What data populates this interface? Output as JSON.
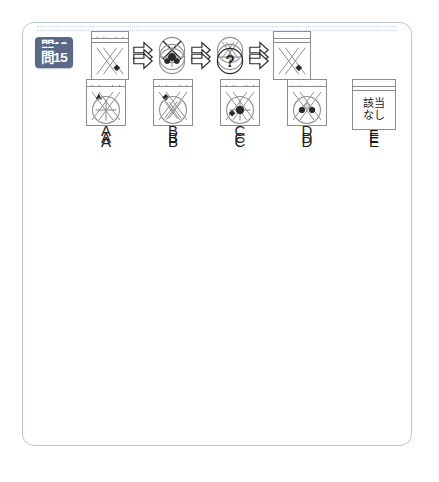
{
  "panel": {
    "border_color": "#b9c4d8",
    "separator_color": "#cfd7e6"
  },
  "badge": {
    "color": "#5a6a86",
    "text_color": "#ffffff"
  },
  "none_label": {
    "line1": "該当",
    "line2": "なし"
  },
  "question_mark": "?",
  "questions": [
    {
      "id": "q13",
      "badge": "問13",
      "sequence": [
        {
          "name": "double-x-box-icon",
          "kind": "box",
          "glyph": "double-x"
        },
        {
          "name": "arrow-right-icon",
          "kind": "arrow",
          "glyph": "arrow"
        },
        {
          "name": "circle-x-icon",
          "kind": "circle",
          "glyph": "circle-x-large"
        },
        {
          "name": "arrow-right-icon",
          "kind": "arrow",
          "glyph": "arrow"
        },
        {
          "name": "circle-double-x-icon",
          "kind": "circle",
          "glyph": "circle-double-x"
        },
        {
          "name": "arrow-right-icon",
          "kind": "arrow",
          "glyph": "arrow"
        },
        {
          "name": "question-box",
          "kind": "qbox",
          "glyph": "question"
        }
      ],
      "options": [
        {
          "label": "A",
          "kind": "box",
          "glyph": "double-x-tri-top"
        },
        {
          "label": "B",
          "kind": "box",
          "glyph": "double-x-tri-center"
        },
        {
          "label": "C",
          "kind": "box",
          "glyph": "double-x-diamond-center"
        },
        {
          "label": "D",
          "kind": "box",
          "glyph": "double-x-faint"
        },
        {
          "label": "E",
          "kind": "none",
          "glyph": "none"
        }
      ]
    },
    {
      "id": "q14",
      "badge": "問14",
      "sequence": [
        {
          "name": "question-box",
          "kind": "qbox",
          "glyph": "question"
        },
        {
          "name": "arrow-right-icon",
          "kind": "arrow",
          "glyph": "arrow"
        },
        {
          "name": "circle-cross-dot-icon",
          "kind": "circle",
          "glyph": "circle-cross-dot"
        },
        {
          "name": "arrow-right-icon",
          "kind": "arrow",
          "glyph": "arrow"
        },
        {
          "name": "circle-cross-icon",
          "kind": "circle",
          "glyph": "circle-cross"
        },
        {
          "name": "arrow-right-icon",
          "kind": "arrow",
          "glyph": "arrow"
        },
        {
          "name": "double-x-box-icon",
          "kind": "box",
          "glyph": "double-x"
        }
      ],
      "options": [
        {
          "label": "A",
          "kind": "box",
          "glyph": "double-x-tri-topleft"
        },
        {
          "label": "B",
          "kind": "box",
          "glyph": "double-x-diamond-topleft"
        },
        {
          "label": "C",
          "kind": "box",
          "glyph": "double-x-diamond-bottomleft"
        },
        {
          "label": "D",
          "kind": "box",
          "glyph": "double-x-diamond-faint-center"
        },
        {
          "label": "E",
          "kind": "none",
          "glyph": "none"
        }
      ]
    },
    {
      "id": "q15",
      "badge": "問15",
      "sequence": [
        {
          "name": "double-x-diamond-box-icon",
          "kind": "box",
          "glyph": "double-x-diamond-br"
        },
        {
          "name": "arrow-right-icon",
          "kind": "arrow",
          "glyph": "arrow"
        },
        {
          "name": "circle-two-dots-icon",
          "kind": "circle",
          "glyph": "circle-two-dots"
        },
        {
          "name": "arrow-right-icon",
          "kind": "arrow",
          "glyph": "arrow"
        },
        {
          "name": "question-circle-icon",
          "kind": "circle",
          "glyph": "circle-question"
        },
        {
          "name": "arrow-right-icon",
          "kind": "arrow",
          "glyph": "arrow"
        },
        {
          "name": "double-x-diamond-box-icon",
          "kind": "box",
          "glyph": "double-x-diamond-br"
        }
      ],
      "options": [
        {
          "label": "A",
          "kind": "circle",
          "glyph": "circle-cross"
        },
        {
          "label": "B",
          "kind": "circle",
          "glyph": "circle-double-x"
        },
        {
          "label": "C",
          "kind": "circle",
          "glyph": "circle-cross-dot"
        },
        {
          "label": "D",
          "kind": "circle",
          "glyph": "circle-two-dots"
        },
        {
          "label": "E",
          "kind": "none",
          "glyph": "none"
        }
      ]
    }
  ]
}
